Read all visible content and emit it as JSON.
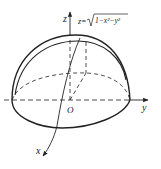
{
  "figure": {
    "type": "upper hemisphere with 3D coordinate axes",
    "surface_equation": "z=√(1−x²−y²)",
    "equation_prefix": "z=",
    "equation_radicand": "1−x²−y²",
    "axes": {
      "x_label": "x",
      "y_label": "y",
      "z_label": "z",
      "origin_label": "O"
    },
    "colors": {
      "stroke": "#222222",
      "background": "#ffffff"
    }
  }
}
